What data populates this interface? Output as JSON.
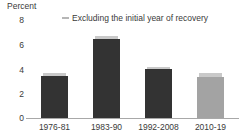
{
  "chart_data": {
    "type": "bar",
    "title": "",
    "ylabel": "Percent",
    "xlabel": "",
    "ylim": [
      0,
      8
    ],
    "yticks": [
      0,
      2,
      4,
      6,
      8
    ],
    "ytick_labels": [
      "0",
      "2",
      "4",
      "6",
      "8"
    ],
    "grid": false,
    "categories": [
      "1976-81",
      "1983-90",
      "1992-2008",
      "2010-19"
    ],
    "legend": {
      "position": "top-center",
      "entries": [
        {
          "label": "Excluding the initial year of recovery",
          "marker": "dash-marker",
          "color": "#b6b6b6"
        }
      ]
    },
    "series": [
      {
        "name": "Average growth",
        "values": [
          3.4,
          6.4,
          4.0,
          3.35
        ],
        "colors": [
          "#333333",
          "#333333",
          "#333333",
          "#a3a3a3"
        ]
      },
      {
        "name": "Excluding the initial year of recovery",
        "values": [
          3.6,
          6.6,
          4.15,
          3.6
        ],
        "color": "#c9c9c9"
      }
    ]
  },
  "colors": {
    "bar_dark": "#333333",
    "bar_light": "#a3a3a3",
    "cap": "#c9c9c9",
    "axis": "#a8a8a8",
    "text": "#3a3a3a",
    "background": "#ffffff"
  }
}
